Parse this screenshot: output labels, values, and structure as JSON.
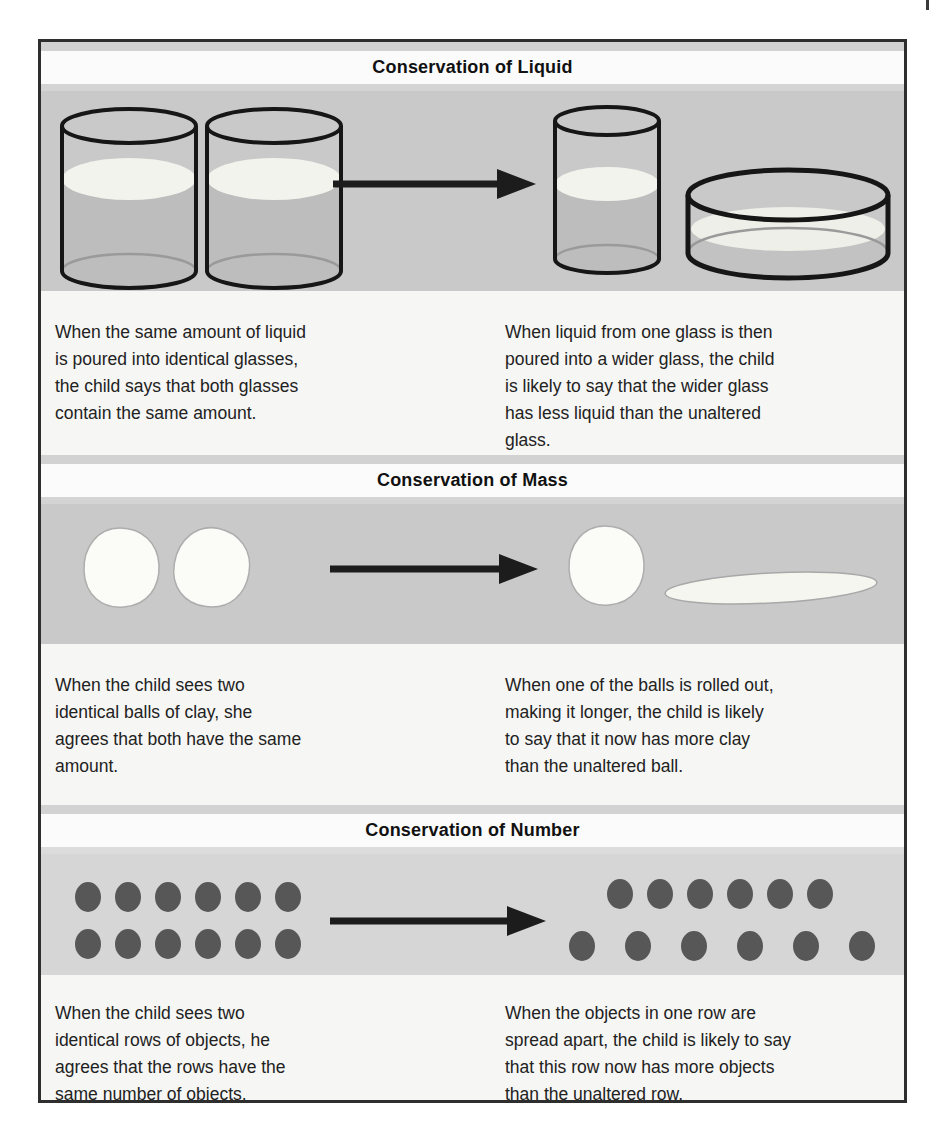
{
  "figure": {
    "panels": [
      {
        "title": "Conservation of Liquid",
        "left_caption": "When the same amount of liquid is poured into identical glasses, the child says that both glasses contain the same amount.",
        "right_caption": "When liquid from one glass is then poured into a wider glass, the child is likely to say that the wider glass has less liquid than the unaltered glass.",
        "illustration": {
          "before_glasses": 2,
          "after_glasses": 2,
          "after_shapes": [
            "tall glass",
            "wider shallow glass"
          ]
        }
      },
      {
        "title": "Conservation of Mass",
        "left_caption": "When the child sees two identical balls of clay, she agrees that both have the same amount.",
        "right_caption": "When one of the balls is rolled out, making it longer, the child is likely to say that it now has more clay than the unaltered ball.",
        "illustration": {
          "before_balls": 2,
          "after_shapes": [
            "ball",
            "rolled-out longer piece"
          ]
        }
      },
      {
        "title": "Conservation of Number",
        "left_caption": "When the child sees two identical rows of objects, he agrees that the rows have the same number of objects.",
        "right_caption": "When the objects in one row are spread apart, the child is likely to say that this row now has more objects than the unaltered row.",
        "illustration": {
          "before_rows": [
            6,
            6
          ],
          "after_rows": [
            6,
            6
          ],
          "after_note": "bottom row spread apart"
        }
      }
    ],
    "colors": {
      "illustration_band": "#c9c9c9",
      "number_band": "#d6d6d6",
      "strip_gray": "#d2d2d2",
      "title_band": "#fbfbfb",
      "caption_band": "#f6f6f4",
      "dot": "#575757",
      "glass_outline": "#161616",
      "liquid_surface": "#f3f3ee",
      "liquid_body": "#bdbdbd",
      "arrow": "#1c1c1c",
      "border": "#2e2e2e"
    }
  }
}
